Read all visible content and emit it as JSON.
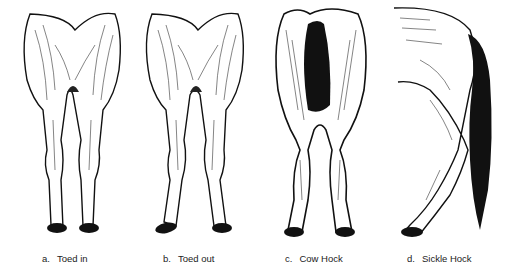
{
  "figures": [
    {
      "letter": "a.",
      "label": "Toed in",
      "icon": "horse-legs-toed-in-icon"
    },
    {
      "letter": "b.",
      "label": "Toed out",
      "icon": "horse-legs-toed-out-icon"
    },
    {
      "letter": "c.",
      "label": "Cow Hock",
      "icon": "horse-hind-cow-hock-icon"
    },
    {
      "letter": "d.",
      "label": "Sickle Hock",
      "icon": "horse-hind-sickle-hock-icon"
    }
  ],
  "colors": {
    "ink": "#111111",
    "paper": "#ffffff"
  }
}
